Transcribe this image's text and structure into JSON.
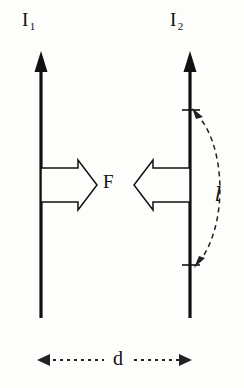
{
  "figure": {
    "background_color": "#fdfdfb",
    "ink_color": "#111111"
  },
  "labels": {
    "current_left": "I",
    "current_left_sub": "1",
    "current_right": "I",
    "current_right_sub": "2",
    "force": "F",
    "length": "l",
    "distance": "d"
  },
  "diagram": {
    "wires": [
      {
        "name": "left-wire",
        "current": "I1",
        "direction": "up",
        "x": 41,
        "top_y": 52,
        "bottom_y": 318
      },
      {
        "name": "right-wire",
        "current": "I2",
        "direction": "up",
        "x": 190,
        "top_y": 52,
        "bottom_y": 318
      }
    ],
    "force_arrows": [
      {
        "name": "force-arrow-left",
        "points": "right",
        "from_x": 41,
        "tip_x": 96,
        "center_y": 185,
        "style": "hollow-outline"
      },
      {
        "name": "force-arrow-right",
        "points": "left",
        "from_x": 190,
        "tip_x": 136,
        "center_y": 185,
        "style": "hollow-outline"
      }
    ],
    "length_marker": {
      "name": "length-brace",
      "style": "dashed-curve-double-arrow",
      "on_wire": "right-wire",
      "top_y": 110,
      "bottom_y": 265,
      "bow_x": 228
    },
    "distance_marker": {
      "name": "distance-dimension",
      "style": "dotted-double-arrow",
      "y": 360,
      "from_x": 38,
      "to_x": 192
    }
  }
}
